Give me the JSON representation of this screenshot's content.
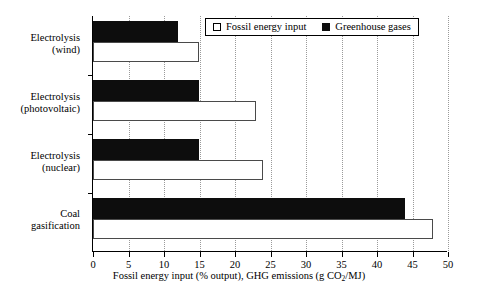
{
  "chart_data": {
    "type": "bar",
    "orientation": "horizontal",
    "title": "",
    "xlabel": "Fossil energy input (% output), GHG emissions (g CO2/MJ)",
    "ylabel": "",
    "xlim": [
      0,
      50
    ],
    "xticks": [
      0,
      5,
      10,
      15,
      20,
      25,
      30,
      35,
      40,
      45,
      50
    ],
    "xticklabels": [
      "0",
      "5",
      "10",
      "15",
      "20",
      "25",
      "30",
      "35",
      "40",
      "45",
      "50"
    ],
    "grid": "vertical dotted gridlines at each x tick",
    "legend_position": "top-right inside axes",
    "categories": [
      "Electrolysis (wind)",
      "Electrolysis (photovoltaic)",
      "Electrolysis (nuclear)",
      "Coal gasification"
    ],
    "series": [
      {
        "name": "Fossil energy input",
        "style": "white fill, black outline",
        "color": "#ffffff",
        "values": [
          15,
          23,
          24,
          48
        ]
      },
      {
        "name": "Greenhouse gases",
        "style": "solid black fill",
        "color": "#0d0d0d",
        "values": [
          12,
          15,
          15,
          44
        ]
      }
    ]
  },
  "axis": {
    "x_title_main": "Fossil energy input (% output), GHG emissions (g CO",
    "x_title_sub": "2",
    "x_title_tail": "/MJ)",
    "tick_0": "0",
    "tick_5": "5",
    "tick_10": "10",
    "tick_15": "15",
    "tick_20": "20",
    "tick_25": "25",
    "tick_30": "30",
    "tick_35": "35",
    "tick_40": "40",
    "tick_45": "45",
    "tick_50": "50"
  },
  "categories": [
    {
      "line1": "Electrolysis",
      "line2": "(wind)"
    },
    {
      "line1": "Electrolysis",
      "line2": "(photovoltaic)"
    },
    {
      "line1": "Electrolysis",
      "line2": "(nuclear)"
    },
    {
      "line1": "Coal",
      "line2": "gasification"
    }
  ],
  "legend": {
    "fossil_label": "Fossil energy input",
    "ghg_label": "Greenhouse gases",
    "fossil_swatch": "open-square-icon",
    "ghg_swatch": "filled-square-icon"
  },
  "colors": {
    "ghg_fill": "#0d0d0d",
    "fossil_fill": "#ffffff",
    "fossil_stroke": "#4a4a4a",
    "axis": "#000000",
    "gridline": "#9a9a9a"
  }
}
